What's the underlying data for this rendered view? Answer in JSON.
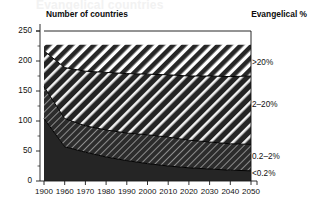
{
  "figure": {
    "ghost_title": "Evangelical countries",
    "header_left": "Number of countries",
    "header_right": "Evangelical %"
  },
  "chart_data": {
    "type": "area",
    "title": "",
    "subtitle": "",
    "xlabel": "",
    "ylabel": "Number of countries",
    "stacked": true,
    "grid": false,
    "legend_position": "right-outside",
    "xlim": [
      1900,
      2050
    ],
    "ylim": [
      0,
      250
    ],
    "yticks": [
      0,
      50,
      100,
      150,
      200,
      250
    ],
    "ytick_labels": [
      "0",
      "50",
      "100",
      "150",
      "200",
      "250"
    ],
    "y_minor_ticks": [
      25,
      75,
      125,
      175,
      225
    ],
    "x": [
      1900,
      1960,
      1970,
      1980,
      1990,
      2000,
      2010,
      2020,
      2030,
      2040,
      2050
    ],
    "xtick_labels": [
      "1900",
      "1960",
      "1970",
      "1980",
      "1990",
      "2000",
      "2010",
      "2020",
      "2030",
      "2040",
      "2050"
    ],
    "total_top": [
      227,
      227,
      227,
      227,
      227,
      227,
      227,
      227,
      227,
      227,
      227
    ],
    "series": [
      {
        "name": "<0.2%",
        "label": "<0.2%",
        "fill": "solid-dark",
        "color": "#2a2a2a",
        "values": [
          104,
          57,
          48,
          40,
          34,
          29,
          25,
          22,
          20,
          18,
          17
        ]
      },
      {
        "name": "0.2-2%",
        "label": "0.2–2%",
        "fill": "fine-diagonal-light-on-dark",
        "color": "#2f2f2f",
        "values": [
          53,
          47,
          44,
          45,
          46,
          48,
          48,
          46,
          45,
          44,
          44
        ]
      },
      {
        "name": "2-20%",
        "label": "2–20%",
        "fill": "bold-diagonal-white-on-dark",
        "color": "#1f1f1f",
        "values": [
          60,
          85,
          91,
          96,
          99,
          101,
          104,
          107,
          110,
          112,
          114
        ]
      },
      {
        "name": ">20%",
        "label": ">20%",
        "fill": "diagonal-dark-on-white",
        "color": "#ffffff",
        "values": [
          10,
          38,
          44,
          46,
          48,
          49,
          50,
          52,
          52,
          53,
          52
        ]
      }
    ],
    "cumulative_boundaries": {
      "below_0_2": [
        104,
        57,
        48,
        40,
        34,
        29,
        25,
        22,
        20,
        18,
        17
      ],
      "below_2": [
        157,
        104,
        92,
        85,
        80,
        77,
        73,
        68,
        65,
        62,
        61
      ],
      "below_20": [
        217,
        189,
        183,
        181,
        179,
        178,
        177,
        175,
        175,
        174,
        175
      ],
      "top": [
        227,
        227,
        227,
        227,
        227,
        227,
        227,
        227,
        227,
        227,
        227
      ]
    },
    "band_labels": [
      {
        "text": ">20%",
        "value_y": 196
      },
      {
        "text": "2–20%",
        "value_y": 126
      },
      {
        "text": "0.2–2%",
        "value_y": 40
      },
      {
        "text": "<0.2%",
        "value_y": 12
      }
    ]
  }
}
